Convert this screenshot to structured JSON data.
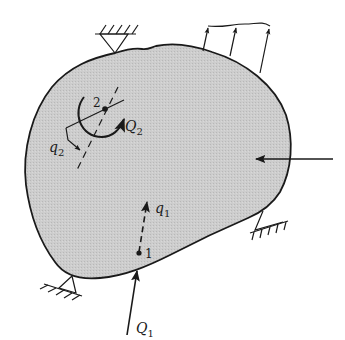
{
  "figure": {
    "type": "mechanics free-body diagram",
    "body_fill": "#c8c8c8",
    "stroke_color": "#1a1a1a"
  },
  "points": [
    {
      "id": "1",
      "label": "1"
    },
    {
      "id": "2",
      "label": "2"
    }
  ],
  "labels": {
    "q1_main": "q",
    "q1_sub": "1",
    "q2_main": "q",
    "q2_sub": "2",
    "Q1_main": "Q",
    "Q1_sub": "1",
    "Q2_main": "Q",
    "Q2_sub": "2",
    "point1": "1",
    "point2": "2"
  },
  "supports": [
    {
      "name": "top-support"
    },
    {
      "name": "right-support"
    },
    {
      "name": "bottom-left-support"
    }
  ],
  "loads": {
    "distributed_load_arrows": 3,
    "concentrated_force_right": "horizontal arrow pointing left"
  }
}
